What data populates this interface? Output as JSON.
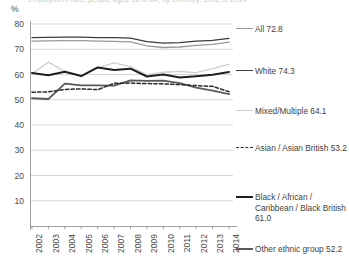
{
  "header": {
    "clipped_title": "Employment rate, people aged 16 to 64, by ethnicity, 2002 to 2014",
    "unit_label": "%"
  },
  "legend": {
    "position": "right",
    "items": [
      {
        "label": "All 72.8",
        "name": "all",
        "color": "#9a9a9a",
        "style": "solid",
        "width": 1.3
      },
      {
        "label": "White 74.3",
        "name": "white",
        "color": "#3d3d3d",
        "style": "solid",
        "width": 1.4
      },
      {
        "label": "Mixed/Multiple 64.1",
        "name": "mixed",
        "color": "#cfcfcf",
        "style": "solid",
        "width": 1.3
      },
      {
        "label": "Asian / Asian British 53.2",
        "name": "asian",
        "color": "#2b2b2b",
        "style": "dashed",
        "width": 1.5
      },
      {
        "label": "Black / African / Caribbean / Black British 61.0",
        "name": "black",
        "color": "#1f1f1f",
        "style": "solid",
        "width": 2.1
      },
      {
        "label": "Other ethnic group 52.2",
        "name": "other",
        "color": "#5a5a5a",
        "style": "solid",
        "width": 1.9
      }
    ]
  },
  "chart_data": {
    "type": "line",
    "title": "Employment rate, people aged 16 to 64, by ethnicity, 2002 to 2014",
    "xlabel": "",
    "ylabel": "%",
    "ylim": [
      0,
      80
    ],
    "ytick_step": 10,
    "yticks": [
      80,
      70,
      60,
      50,
      40,
      30,
      20,
      10
    ],
    "grid": true,
    "x": [
      2002,
      2003,
      2004,
      2005,
      2006,
      2007,
      2008,
      2009,
      2010,
      2011,
      2012,
      2013,
      2014
    ],
    "categories": [
      "2002",
      "2003",
      "2004",
      "2005",
      "2006",
      "2007",
      "2008",
      "2009",
      "2010",
      "2011",
      "2012",
      "2013",
      "2014"
    ],
    "series": [
      {
        "name": "White",
        "color": "#3d3d3d",
        "style": "solid",
        "end_value": 74.3,
        "values": [
          74.6,
          74.7,
          74.8,
          74.8,
          74.6,
          74.6,
          74.4,
          73.0,
          72.4,
          72.6,
          73.2,
          73.5,
          74.3
        ]
      },
      {
        "name": "All",
        "color": "#9a9a9a",
        "style": "solid",
        "end_value": 72.8,
        "values": [
          73.2,
          73.3,
          73.4,
          73.4,
          73.2,
          73.1,
          72.9,
          71.3,
          70.7,
          70.9,
          71.5,
          71.9,
          72.8
        ]
      },
      {
        "name": "Mixed/Multiple",
        "color": "#cfcfcf",
        "style": "solid",
        "end_value": 64.1,
        "values": [
          60.3,
          64.9,
          61.2,
          59.6,
          62.6,
          64.6,
          63.1,
          59.9,
          60.9,
          61.2,
          60.7,
          62.3,
          64.1
        ]
      },
      {
        "name": "Black / African / Caribbean / Black British",
        "color": "#1f1f1f",
        "style": "solid",
        "end_value": 61.0,
        "values": [
          60.6,
          59.7,
          61.1,
          59.4,
          62.8,
          61.8,
          62.3,
          59.2,
          60.0,
          58.8,
          59.3,
          59.9,
          61.0
        ]
      },
      {
        "name": "Asian / Asian British",
        "color": "#2b2b2b",
        "style": "dashed",
        "end_value": 53.2,
        "values": [
          53.0,
          53.1,
          54.1,
          54.3,
          54.0,
          56.5,
          56.6,
          56.4,
          56.3,
          56.0,
          55.6,
          55.3,
          53.2
        ]
      },
      {
        "name": "Other ethnic group",
        "color": "#5a5a5a",
        "style": "solid",
        "end_value": 52.2,
        "values": [
          50.6,
          50.3,
          56.4,
          55.7,
          55.7,
          55.6,
          57.7,
          57.5,
          57.6,
          56.6,
          54.8,
          53.6,
          52.2
        ]
      }
    ]
  }
}
